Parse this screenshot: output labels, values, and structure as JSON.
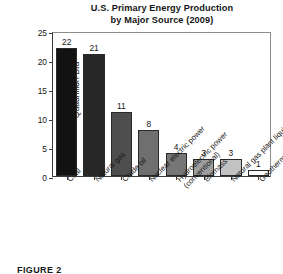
{
  "chart_data": {
    "type": "bar",
    "title": "U.S. Primary Energy Production by Major Source (2009)",
    "title_line1": "U.S. Primary Energy Production",
    "title_line2": "by Major Source (2009)",
    "xlabel": "",
    "ylabel": "Quadrillion Btu",
    "ylim": [
      0,
      25
    ],
    "yticks": [
      0,
      5,
      10,
      15,
      20,
      25
    ],
    "ytick_labels": [
      "0",
      "5",
      "10",
      "15",
      "20",
      "25"
    ],
    "grid": false,
    "legend": "none",
    "categories": [
      "Coal",
      "Natural gas",
      "Crude oil",
      "Nuclear electric power",
      "Hydroelectric power\n(conventional)",
      "Biomass",
      "Natural gas plant liquids",
      "Geothermal, solar/PV, wind"
    ],
    "values": [
      22,
      21,
      11,
      8,
      4,
      3,
      3,
      1
    ],
    "value_labels": [
      "22",
      "21",
      "11",
      "8",
      "4",
      "3",
      "3",
      "1"
    ],
    "bar_colors": [
      "#121212",
      "#272727",
      "#4e4e4e",
      "#6f6f6f",
      "#767676",
      "#9e9e9e",
      "#c2c2c2",
      "#fbfbfb"
    ],
    "bar_edge_color": "#2a2a2a",
    "axis_color": "#3a3a3a",
    "background": "#ffffff",
    "text_color": "#161616"
  },
  "caption": {
    "text": "FIGURE 2"
  }
}
